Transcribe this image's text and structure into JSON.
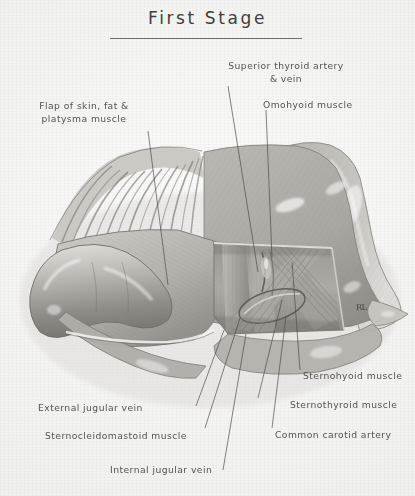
{
  "plate": {
    "title": "First Stage",
    "signature": "RL",
    "background_color": "#f4f4f2",
    "ink_color": "#4a4a48",
    "medium": "grayscale pencil and wash anatomical illustration"
  },
  "labels": [
    {
      "id": "superior-thyroid-artery-vein",
      "line1": "Superior thyroid artery",
      "line2": "& vein"
    },
    {
      "id": "omohyoid-muscle",
      "line1": "Omohyoid muscle",
      "line2": ""
    },
    {
      "id": "flap-of-skin-fat-platysma",
      "line1": "Flap of skin, fat &",
      "line2": "platysma  muscle"
    },
    {
      "id": "sternohyoid-muscle",
      "line1": "Sternohyoid muscle",
      "line2": ""
    },
    {
      "id": "sternothyroid-muscle",
      "line1": "Sternothyroid muscle",
      "line2": ""
    },
    {
      "id": "common-carotid-artery",
      "line1": "Common carotid artery",
      "line2": ""
    },
    {
      "id": "external-jugular-vein",
      "line1": "External jugular vein",
      "line2": ""
    },
    {
      "id": "sternocleidomastoid-muscle",
      "line1": "Sternocleidomastoid  muscle",
      "line2": ""
    },
    {
      "id": "internal-jugular-vein",
      "line1": "Internal jugular vein",
      "line2": ""
    }
  ]
}
